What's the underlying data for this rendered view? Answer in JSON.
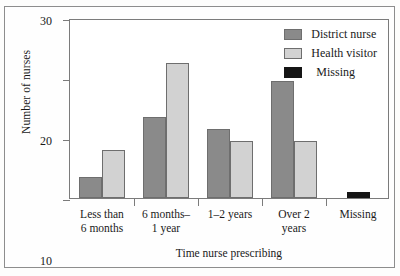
{
  "chart_data": {
    "type": "bar",
    "title": "",
    "xlabel": "Time nurse prescribing",
    "ylabel": "Number of nurses",
    "categories": [
      "Less than\n6 months",
      "6 months–\n1 year",
      "1–2 years",
      "Over 2\nyears",
      "Missing"
    ],
    "series": [
      {
        "name": "District nurse",
        "color": "#8a8a8a",
        "values": [
          3.5,
          13.5,
          11.5,
          19.5,
          0
        ]
      },
      {
        "name": "Health visitor",
        "color": "#d2d2d2",
        "values": [
          8,
          22.5,
          9.5,
          9.5,
          0
        ]
      },
      {
        "name": "Missing",
        "color": "#151515",
        "values": [
          0,
          0,
          0,
          0,
          1
        ]
      }
    ],
    "ylim": [
      0,
      30
    ],
    "yticks": [
      0,
      10,
      20,
      30
    ],
    "ytick_labels": [
      "0",
      "10",
      "20",
      "30"
    ],
    "grid": false,
    "legend_position": "top-right"
  },
  "legend": {
    "items": [
      {
        "label": "District nurse",
        "color": "#8a8a8a"
      },
      {
        "label": "Health visitor",
        "color": "#d2d2d2"
      },
      {
        "label": "Missing",
        "color": "#151515"
      }
    ]
  }
}
